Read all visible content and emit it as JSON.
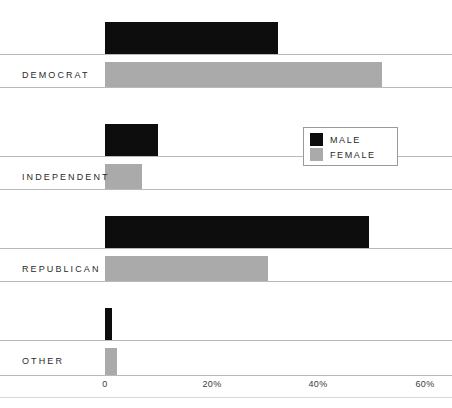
{
  "chart_data": {
    "type": "bar",
    "orientation": "horizontal",
    "title": "",
    "subtitle": "",
    "xlabel": "",
    "ylabel": "",
    "categories": [
      "DEMOCRAT",
      "INDEPENDENT",
      "REPUBLICAN",
      "OTHER"
    ],
    "series": [
      {
        "name": "MALE",
        "color": "#0d0d0d",
        "values": [
          32.5,
          10.0,
          49.5,
          1.3
        ]
      },
      {
        "name": "FEMALE",
        "color": "#abaaaa",
        "values": [
          52.0,
          7.0,
          30.5,
          2.2
        ]
      }
    ],
    "xlim": [
      0,
      60
    ],
    "xticks": [
      0,
      20,
      40,
      60
    ],
    "xtick_labels": [
      "0",
      "20%",
      "40%",
      "60%"
    ],
    "grid": true,
    "legend_position": "middle-right"
  },
  "legend": {
    "items": [
      {
        "label": "MALE",
        "swatch": "male"
      },
      {
        "label": "FEMALE",
        "swatch": "female"
      }
    ]
  },
  "axis": {
    "ticks": [
      {
        "label": "0"
      },
      {
        "label": "20%"
      },
      {
        "label": "40%"
      },
      {
        "label": "60%"
      }
    ]
  },
  "groups": [
    {
      "label": "DEMOCRAT"
    },
    {
      "label": "INDEPENDENT"
    },
    {
      "label": "REPUBLICAN"
    },
    {
      "label": "OTHER"
    }
  ],
  "colors": {
    "male": "#0d0d0d",
    "female": "#abaaaa",
    "gridline": "#b9b9b9",
    "text": "#2b2b2b",
    "background": "#ffffff"
  }
}
